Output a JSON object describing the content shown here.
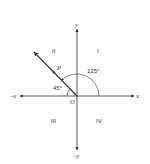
{
  "diagram": {
    "type": "angle-in-standard-position",
    "axes": {
      "x_positive_label": "x",
      "x_negative_label": "-x",
      "y_positive_label": "y",
      "y_negative_label": "-y",
      "origin_label": "O"
    },
    "quadrants": {
      "q1": "I",
      "q2": "II",
      "q3": "III",
      "q4": "IV"
    },
    "terminal_ray": {
      "point_label": "P",
      "angle_label": "135°",
      "reference_angle_label": "45°"
    },
    "colors": {
      "line": "#333333",
      "background": "#ffffff"
    }
  }
}
